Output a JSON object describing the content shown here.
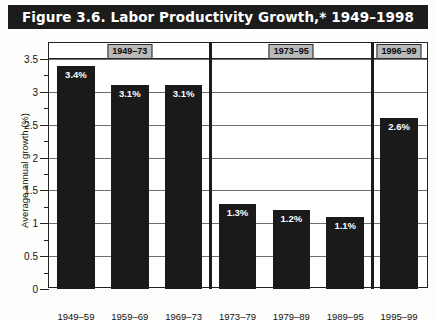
{
  "figure": {
    "title": "Figure 3.6. Labor Productivity Growth,* 1949–1998"
  },
  "chart_data": {
    "type": "bar",
    "title": "Figure 3.6. Labor Productivity Growth,* 1949–1998",
    "xlabel": "",
    "ylabel": "Average annual growth (%)",
    "ylim": [
      0,
      3.5
    ],
    "ytick_step": 0.5,
    "yminor_step": 0.25,
    "grid": true,
    "legend": "none",
    "bar_color": "#1a1a1a",
    "categories": [
      "1949–59",
      "1959–69",
      "1969–73",
      "1973–79",
      "1979–89",
      "1989–95",
      "1995–99"
    ],
    "values": [
      3.4,
      3.1,
      3.1,
      1.3,
      1.2,
      1.1,
      2.6
    ],
    "value_labels": [
      "3.4%",
      "3.1%",
      "3.1%",
      "1.3%",
      "1.2%",
      "1.1%",
      "2.6%"
    ],
    "ytick_labels": [
      "0",
      "0.5",
      "1",
      "1.5",
      "2",
      "2.5",
      "3",
      "3.5"
    ],
    "ytick_values": [
      0,
      0.5,
      1,
      1.5,
      2,
      2.5,
      3,
      3.5
    ],
    "groups": [
      {
        "label": "1949–73",
        "start_index": 0,
        "end_index": 2
      },
      {
        "label": "1973–95",
        "start_index": 3,
        "end_index": 5
      },
      {
        "label": "1996–99",
        "start_index": 6,
        "end_index": 6
      }
    ]
  }
}
